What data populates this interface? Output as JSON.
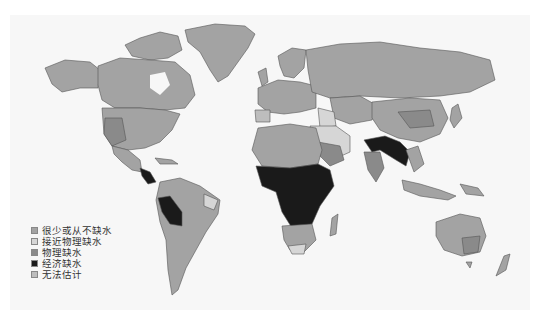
{
  "map": {
    "title": "",
    "colors": {
      "little_or_no": "#a3a3a3",
      "approaching_physical": "#cfcfcf",
      "physical": "#8a8a8a",
      "economic": "#1a1a1a",
      "not_estimated": "#b8b8b8",
      "ocean": "#f7f7f7"
    }
  },
  "legend": {
    "items": [
      {
        "label": "很少或从不缺水",
        "color": "#a3a3a3"
      },
      {
        "label": "接近物理缺水",
        "color": "#d6d6d6"
      },
      {
        "label": "物理缺水",
        "color": "#8a8a8a"
      },
      {
        "label": "经济缺水",
        "color": "#1a1a1a"
      },
      {
        "label": "无法估计",
        "color": "#bdbdbd"
      }
    ]
  }
}
